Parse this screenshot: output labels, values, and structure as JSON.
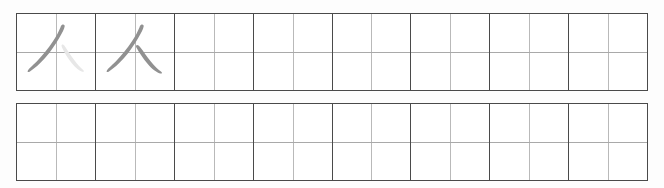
{
  "worksheet": {
    "type": "chinese-character-tracing-practice-sheet",
    "character": "人",
    "character_meaning_label": "",
    "stroke_count": 2,
    "ink_color": "#919191",
    "trace_guide_color": "#e7e7e7",
    "grid_line_color": "#4a4a4a",
    "inner_guide_color": "#b9b9b9",
    "background_color": "#ffffff",
    "rows": [
      {
        "row_label": "row-1",
        "cells": [
          {
            "index": 0,
            "content": "人",
            "mode": "partial-trace",
            "strokes": [
              {
                "name": "pie",
                "order": 1,
                "style": "solid"
              },
              {
                "name": "na",
                "order": 2,
                "style": "faded"
              }
            ]
          },
          {
            "index": 1,
            "content": "人",
            "mode": "model",
            "strokes": [
              {
                "name": "pie",
                "order": 1,
                "style": "solid"
              },
              {
                "name": "na",
                "order": 2,
                "style": "solid"
              }
            ]
          },
          {
            "index": 2,
            "content": "",
            "mode": "empty",
            "strokes": []
          },
          {
            "index": 3,
            "content": "",
            "mode": "empty",
            "strokes": []
          },
          {
            "index": 4,
            "content": "",
            "mode": "empty",
            "strokes": []
          },
          {
            "index": 5,
            "content": "",
            "mode": "empty",
            "strokes": []
          },
          {
            "index": 6,
            "content": "",
            "mode": "empty",
            "strokes": []
          },
          {
            "index": 7,
            "content": "",
            "mode": "empty",
            "strokes": []
          }
        ]
      },
      {
        "row_label": "row-2",
        "cells": [
          {
            "index": 0,
            "content": "",
            "mode": "empty",
            "strokes": []
          },
          {
            "index": 1,
            "content": "",
            "mode": "empty",
            "strokes": []
          },
          {
            "index": 2,
            "content": "",
            "mode": "empty",
            "strokes": []
          },
          {
            "index": 3,
            "content": "",
            "mode": "empty",
            "strokes": []
          },
          {
            "index": 4,
            "content": "",
            "mode": "empty",
            "strokes": []
          },
          {
            "index": 5,
            "content": "",
            "mode": "empty",
            "strokes": []
          },
          {
            "index": 6,
            "content": "",
            "mode": "empty",
            "strokes": []
          },
          {
            "index": 7,
            "content": "",
            "mode": "empty",
            "strokes": []
          }
        ]
      }
    ]
  }
}
